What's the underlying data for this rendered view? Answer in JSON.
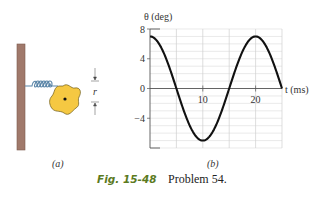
{
  "figure": {
    "number": "Fig. 15-48",
    "caption": "Problem 54.",
    "panel_a_label": "(a)",
    "panel_b_label": "(b)",
    "panel_a": {
      "dimension_label": "r",
      "wall_color": "#a0796b",
      "disk_color": "#f5c842",
      "spring_color": "#5b86a8"
    }
  },
  "chart_data": {
    "type": "line",
    "title": "",
    "xlabel": "t (ms)",
    "ylabel": "θ (deg)",
    "xlim": [
      0,
      25
    ],
    "ylim": [
      -8,
      8
    ],
    "xticks": [
      10,
      20
    ],
    "yticks": [
      8,
      4,
      0,
      -4
    ],
    "ytick_labels": [
      "8",
      "4",
      "0",
      "−4"
    ],
    "grid": true,
    "grid_x_step": 5,
    "grid_y_step": 1,
    "legend": null,
    "series": [
      {
        "name": "θ(t)",
        "function": "7 cos(2π t / 20)",
        "amplitude": 7,
        "period": 20,
        "x": [
          0,
          2.5,
          5,
          7.5,
          10,
          12.5,
          15,
          17.5,
          20,
          22.5,
          25
        ],
        "y": [
          7,
          4.95,
          0,
          -4.95,
          -7,
          -4.95,
          0,
          4.95,
          7,
          4.95,
          0
        ]
      }
    ]
  }
}
